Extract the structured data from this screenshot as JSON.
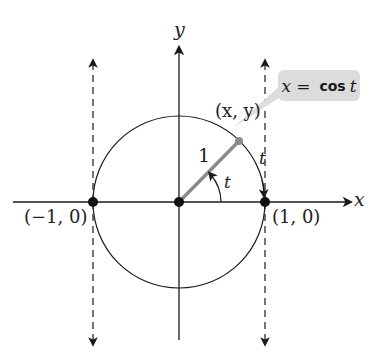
{
  "diagram": {
    "type": "unit-circle",
    "axes": {
      "x_label": "x",
      "y_label": "y"
    },
    "points": [
      {
        "id": "origin",
        "label": ""
      },
      {
        "id": "left",
        "label": "(−1, 0)"
      },
      {
        "id": "right",
        "label": "(1, 0)"
      },
      {
        "id": "on_circle",
        "label": "(x, y)"
      }
    ],
    "radius_label": "1",
    "angle_label": "t",
    "arc_label": "t",
    "callout": {
      "lhs": "x",
      "eq": "=",
      "fn": "cos",
      "arg": "t"
    },
    "colors": {
      "ink": "#1a1a1a",
      "radius": "#8a8a8a",
      "callout_bg": "#dcdcdc"
    }
  }
}
